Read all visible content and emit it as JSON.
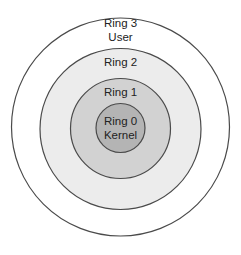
{
  "diagram": {
    "type": "concentric-rings",
    "rings": [
      {
        "id": "ring3",
        "title": "Ring 3",
        "subtitle": "User",
        "fill": "#ffffff",
        "stroke": "#4a4a4a"
      },
      {
        "id": "ring2",
        "title": "Ring 2",
        "subtitle": "",
        "fill": "#ececec",
        "stroke": "#4a4a4a"
      },
      {
        "id": "ring1",
        "title": "Ring 1",
        "subtitle": "",
        "fill": "#d2d2d2",
        "stroke": "#4a4a4a"
      },
      {
        "id": "ring0",
        "title": "Ring 0",
        "subtitle": "Kernel",
        "fill": "#b4b4b4",
        "stroke": "#4a4a4a"
      }
    ]
  }
}
